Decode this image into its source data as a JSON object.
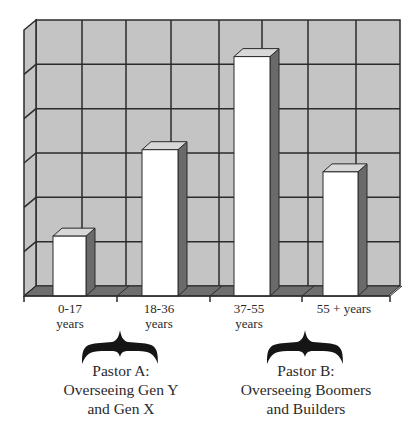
{
  "chart_data": {
    "type": "bar",
    "style": "3d-column",
    "title": "",
    "xlabel": "",
    "ylabel": "",
    "categories": [
      "0-17 years",
      "18-36 years",
      "37-55 years",
      "55 + years"
    ],
    "values": [
      1.35,
      3.3,
      5.4,
      2.8
    ],
    "value_units": "relative gridline units (no y-axis tick labels shown)",
    "ylim": [
      0,
      6
    ],
    "grid": true,
    "gridlines": {
      "horizontal": 6,
      "vertical": 8
    },
    "legend": null,
    "annotations": [
      {
        "text": "Pastor A: Overseeing Gen Y and Gen X",
        "spans": [
          "0-17 years",
          "18-36 years"
        ],
        "marker": "curly-brace"
      },
      {
        "text": "Pastor B: Overseeing Boomers and Builders",
        "spans": [
          "37-55 years",
          "55 + years"
        ],
        "marker": "curly-brace"
      }
    ]
  },
  "labels": {
    "cat0_l1": "0-17",
    "cat0_l2": "years",
    "cat1_l1": "18-36",
    "cat1_l2": "years",
    "cat2_l1": "37-55",
    "cat2_l2": "years",
    "cat3_l1": "55 + years",
    "pastorA_l1": "Pastor A:",
    "pastorA_l2": "Overseeing Gen Y",
    "pastorA_l3": "and Gen X",
    "pastorB_l1": "Pastor B:",
    "pastorB_l2": "Overseeing Boomers",
    "pastorB_l3": "and Builders"
  },
  "colors": {
    "wall": "#c4c4c4",
    "floor": "#6e6e6e",
    "grid": "#2b2b2b",
    "bar_front": "#ffffff",
    "bar_side": "#6a6a6a",
    "bar_top": "#d8d8d8"
  }
}
